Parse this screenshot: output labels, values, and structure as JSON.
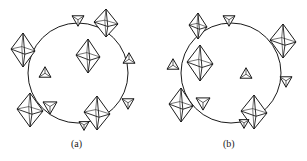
{
  "panels": [
    {
      "id": "a",
      "label": "(a)",
      "circle": {
        "cx": 78,
        "cy": 73,
        "r": 50
      },
      "octahedra": [
        {
          "cx": 23,
          "cy": 50,
          "w": 24,
          "h": 34
        },
        {
          "cx": 88,
          "cy": 56,
          "w": 24,
          "h": 34
        },
        {
          "cx": 106,
          "cy": 23,
          "w": 24,
          "h": 28
        },
        {
          "cx": 30,
          "cy": 110,
          "w": 26,
          "h": 34
        },
        {
          "cx": 97,
          "cy": 113,
          "w": 26,
          "h": 34
        }
      ],
      "tetrahedra": [
        {
          "cx": 78,
          "cy": 21,
          "s": 12,
          "dir": "down"
        },
        {
          "cx": 129,
          "cy": 58,
          "s": 12,
          "dir": "up"
        },
        {
          "cx": 45,
          "cy": 72,
          "s": 12,
          "dir": "up"
        },
        {
          "cx": 50,
          "cy": 108,
          "s": 14,
          "dir": "down"
        },
        {
          "cx": 128,
          "cy": 104,
          "s": 12,
          "dir": "down"
        },
        {
          "cx": 84,
          "cy": 126,
          "s": 10,
          "dir": "down"
        }
      ],
      "caption_pos": {
        "x": 71,
        "y": 140
      }
    },
    {
      "id": "b",
      "label": "(b)",
      "circle": {
        "cx": 231,
        "cy": 73,
        "r": 50
      },
      "octahedra": [
        {
          "cx": 198,
          "cy": 26,
          "w": 18,
          "h": 26
        },
        {
          "cx": 200,
          "cy": 63,
          "w": 26,
          "h": 36
        },
        {
          "cx": 283,
          "cy": 41,
          "w": 26,
          "h": 34
        },
        {
          "cx": 181,
          "cy": 105,
          "w": 24,
          "h": 34
        },
        {
          "cx": 254,
          "cy": 112,
          "w": 26,
          "h": 34
        }
      ],
      "tetrahedra": [
        {
          "cx": 229,
          "cy": 21,
          "s": 12,
          "dir": "down"
        },
        {
          "cx": 173,
          "cy": 64,
          "s": 12,
          "dir": "up"
        },
        {
          "cx": 246,
          "cy": 73,
          "s": 12,
          "dir": "up"
        },
        {
          "cx": 203,
          "cy": 104,
          "s": 14,
          "dir": "down"
        },
        {
          "cx": 286,
          "cy": 82,
          "s": 12,
          "dir": "down"
        },
        {
          "cx": 244,
          "cy": 124,
          "s": 10,
          "dir": "down"
        }
      ],
      "caption_pos": {
        "x": 223,
        "y": 140
      }
    }
  ],
  "style": {
    "stroke": "#1a1a1a",
    "background": "#ffffff"
  }
}
